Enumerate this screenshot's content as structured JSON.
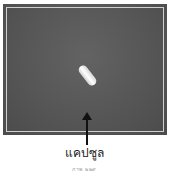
{
  "figure": {
    "image_description": "Photograph of a single white capsule on a dark gray background",
    "label": "แคปซูล",
    "caption": "ภาพ ๒๒๙",
    "colors": {
      "background": "#5a5a5a",
      "frame_line": "#cfcfcf",
      "capsule": "#f2f2f2",
      "arrow": "#111111"
    }
  }
}
